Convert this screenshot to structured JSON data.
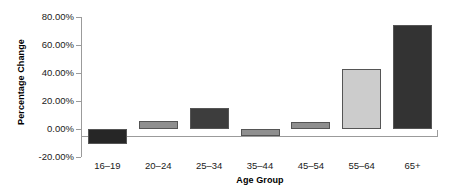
{
  "chart_data": {
    "type": "bar",
    "title": "",
    "subtitle": "",
    "xlabel": "Age Group",
    "ylabel": "Percentage Change",
    "categories": [
      "16–19",
      "20–24",
      "25–34",
      "35–44",
      "45–54",
      "55–64",
      "65+"
    ],
    "values": [
      -0.11,
      0.06,
      0.15,
      -0.05,
      0.05,
      0.43,
      0.74
    ],
    "value_labels": [
      "-11.00%",
      "6.00%",
      "15.00%",
      "-5.00%",
      "5.00%",
      "43.00%",
      "74.00%"
    ],
    "bar_colors": [
      "#262626",
      "#8f8f8f",
      "#3d3d3d",
      "#8f8f8f",
      "#8f8f8f",
      "#cccccc",
      "#333333"
    ],
    "ylim": [
      -0.2,
      0.8
    ],
    "yticks": [
      -0.2,
      0.0,
      0.2,
      0.4,
      0.6,
      0.8
    ],
    "ytick_labels": [
      "-20.00%",
      "0.00%",
      "20.00%",
      "40.00%",
      "60.00%",
      "80.00%"
    ],
    "grid": false,
    "legend": null,
    "legend_position": "none",
    "series": [
      {
        "name": "Percentage Change",
        "values": [
          -0.11,
          0.06,
          0.15,
          -0.05,
          0.05,
          0.43,
          0.74
        ]
      }
    ]
  },
  "axes": {
    "y_title": "Percentage Change",
    "x_title": "Age Group"
  },
  "colors": {
    "axis": "#9b9b9b",
    "text": "#1a1a1a",
    "bar_outline": "#555555",
    "background": "#ffffff"
  }
}
